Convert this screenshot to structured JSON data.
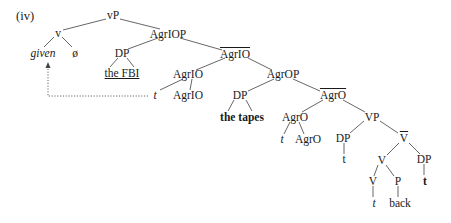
{
  "example_label": "(iv)",
  "nodes": [
    {
      "id": "vP",
      "text": "vP",
      "x": 113,
      "y": 15,
      "style": ""
    },
    {
      "id": "v",
      "text": "v",
      "x": 58,
      "y": 33,
      "style": ""
    },
    {
      "id": "given",
      "text": "given",
      "x": 43,
      "y": 53,
      "style": "it"
    },
    {
      "id": "null",
      "text": "ø",
      "x": 75,
      "y": 53,
      "style": ""
    },
    {
      "id": "AgrIOP",
      "text": "AgrIOP",
      "x": 168,
      "y": 34,
      "style": ""
    },
    {
      "id": "DP1",
      "text": "DP",
      "x": 122,
      "y": 53,
      "style": ""
    },
    {
      "id": "theFBI",
      "text": "the FBI",
      "x": 122,
      "y": 73,
      "style": "ul"
    },
    {
      "id": "AgrIObar",
      "text": "AgrIO",
      "x": 235,
      "y": 54,
      "style": "bar"
    },
    {
      "id": "AgrIO1",
      "text": "AgrIO",
      "x": 188,
      "y": 74,
      "style": ""
    },
    {
      "id": "tIO",
      "text": "t",
      "x": 155,
      "y": 95,
      "style": "it"
    },
    {
      "id": "AgrIO2",
      "text": "AgrIO",
      "x": 188,
      "y": 95,
      "style": ""
    },
    {
      "id": "AgrOP",
      "text": "AgrOP",
      "x": 283,
      "y": 74,
      "style": ""
    },
    {
      "id": "DP2",
      "text": "DP",
      "x": 240,
      "y": 95,
      "style": ""
    },
    {
      "id": "thetapes",
      "text": "the tapes",
      "x": 242,
      "y": 117,
      "style": "bd"
    },
    {
      "id": "AgrObar",
      "text": "AgrO",
      "x": 333,
      "y": 95,
      "style": "bar"
    },
    {
      "id": "AgrO1",
      "text": "AgrO",
      "x": 295,
      "y": 117,
      "style": ""
    },
    {
      "id": "tO",
      "text": "t",
      "x": 282,
      "y": 139,
      "style": "it"
    },
    {
      "id": "AgrO2",
      "text": "AgrO",
      "x": 308,
      "y": 139,
      "style": ""
    },
    {
      "id": "VP",
      "text": "VP",
      "x": 372,
      "y": 117,
      "style": ""
    },
    {
      "id": "DP3",
      "text": "DP",
      "x": 343,
      "y": 138,
      "style": ""
    },
    {
      "id": "t3",
      "text": "t",
      "x": 344,
      "y": 159,
      "style": ""
    },
    {
      "id": "Vbar",
      "text": "V",
      "x": 404,
      "y": 138,
      "style": "bar"
    },
    {
      "id": "V1",
      "text": "V",
      "x": 382,
      "y": 160,
      "style": ""
    },
    {
      "id": "DP4",
      "text": "DP",
      "x": 424,
      "y": 159,
      "style": ""
    },
    {
      "id": "V2",
      "text": "V",
      "x": 373,
      "y": 181,
      "style": ""
    },
    {
      "id": "P",
      "text": "P",
      "x": 398,
      "y": 181,
      "style": ""
    },
    {
      "id": "t4",
      "text": "t",
      "x": 425,
      "y": 181,
      "style": "bd"
    },
    {
      "id": "tV",
      "text": "t",
      "x": 374,
      "y": 203,
      "style": "it"
    },
    {
      "id": "back",
      "text": "back",
      "x": 400,
      "y": 203,
      "style": ""
    }
  ],
  "edges": [
    [
      106,
      19,
      63,
      30
    ],
    [
      120,
      19,
      160,
      29
    ],
    [
      54,
      37,
      44,
      47
    ],
    [
      62,
      37,
      72,
      47
    ],
    [
      158,
      38,
      128,
      49
    ],
    [
      180,
      38,
      222,
      50
    ],
    [
      118,
      58,
      110,
      67
    ],
    [
      127,
      58,
      134,
      67
    ],
    [
      225,
      58,
      196,
      70
    ],
    [
      248,
      58,
      272,
      70
    ],
    [
      183,
      79,
      160,
      90
    ],
    [
      192,
      79,
      190,
      90
    ],
    [
      274,
      79,
      248,
      91
    ],
    [
      293,
      79,
      320,
      91
    ],
    [
      234,
      100,
      228,
      111
    ],
    [
      246,
      100,
      252,
      111
    ],
    [
      323,
      100,
      302,
      112
    ],
    [
      343,
      100,
      365,
      112
    ],
    [
      290,
      122,
      284,
      134
    ],
    [
      299,
      122,
      304,
      134
    ],
    [
      364,
      121,
      350,
      133
    ],
    [
      380,
      121,
      398,
      133
    ],
    [
      344,
      143,
      344,
      154
    ],
    [
      399,
      143,
      387,
      155
    ],
    [
      409,
      143,
      420,
      154
    ],
    [
      378,
      165,
      374,
      176
    ],
    [
      386,
      165,
      394,
      176
    ],
    [
      424,
      164,
      424,
      175
    ],
    [
      373,
      186,
      373,
      197
    ],
    [
      398,
      186,
      398,
      197
    ]
  ],
  "movement_arrow": {
    "points": "148,96 48,96 48,66",
    "style": "dotted"
  }
}
